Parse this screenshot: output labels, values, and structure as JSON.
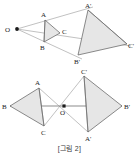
{
  "figure": {
    "caption": "[그림 2]",
    "colors": {
      "triangle_fill": "#e6e6e6",
      "triangle_stroke": "#5a5a5a",
      "ray_stroke": "#8d8d8d",
      "label_color": "#1c1c1c",
      "background": "#ffffff"
    },
    "top_diagram": {
      "name": "homothety-from-external-center",
      "center_label": "O",
      "small_triangle": {
        "labels": [
          "A",
          "B",
          "C"
        ],
        "vertices": [
          [
            45,
            20
          ],
          [
            44,
            42
          ],
          [
            60,
            33
          ]
        ]
      },
      "large_triangle": {
        "labels": [
          "A'",
          "B'",
          "C'"
        ],
        "vertices": [
          [
            88,
            10
          ],
          [
            78,
            55
          ],
          [
            127,
            44
          ]
        ]
      },
      "center_point": [
        17,
        29
      ]
    },
    "bottom_diagram": {
      "name": "point-symmetry-about-center",
      "center_label": "O",
      "left_triangle": {
        "labels": [
          "A",
          "B",
          "C"
        ],
        "vertices": [
          [
            39,
            88
          ],
          [
            10,
            106
          ],
          [
            44,
            126
          ]
        ]
      },
      "right_triangle": {
        "labels": [
          "C'",
          "B'",
          "A'"
        ],
        "vertices": [
          [
            84,
            76
          ],
          [
            122,
            106
          ],
          [
            88,
            132
          ]
        ]
      },
      "center_point": [
        64,
        106
      ]
    },
    "labels": {
      "top": {
        "O": "O",
        "A": "A",
        "B": "B",
        "C": "C",
        "A_prime": "A'",
        "B_prime": "B'",
        "C_prime": "C'"
      },
      "bottom": {
        "O": "O",
        "A": "A",
        "B": "B",
        "C": "C",
        "A_prime": "A'",
        "B_prime": "B'",
        "C_prime": "C'"
      }
    }
  }
}
